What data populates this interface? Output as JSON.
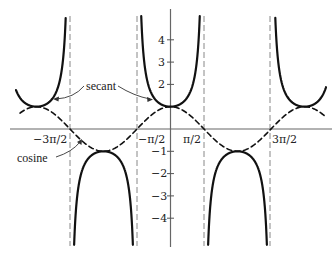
{
  "chart_data": {
    "type": "line",
    "title": "",
    "xlabel": "",
    "ylabel": "",
    "xlim": [
      -5.0,
      5.0
    ],
    "ylim": [
      -5.2,
      5.4
    ],
    "grid": false,
    "x_ticks": [
      {
        "value": -4.712389,
        "label": "−3π/2"
      },
      {
        "value": -1.570796,
        "label": "−π/2"
      },
      {
        "value": 1.570796,
        "label": "π/2"
      },
      {
        "value": 4.712389,
        "label": "3π/2"
      }
    ],
    "y_ticks": [
      {
        "value": 4,
        "label": "4"
      },
      {
        "value": 3,
        "label": "3"
      },
      {
        "value": 2,
        "label": "2"
      },
      {
        "value": 1,
        "label": ""
      },
      {
        "value": -1,
        "label": "−1"
      },
      {
        "value": -2,
        "label": "−2"
      },
      {
        "value": -3,
        "label": "−3"
      },
      {
        "value": -4,
        "label": "−4"
      }
    ],
    "series": [
      {
        "name": "secant",
        "function": "sec(x)",
        "style": "solid",
        "domain": [
          -6.8,
          6.8
        ]
      },
      {
        "name": "cosine",
        "function": "cos(x)",
        "style": "dashed",
        "domain": [
          -6.7,
          6.9
        ]
      }
    ],
    "asymptotes": [
      -4.712389,
      -1.570796,
      1.570796,
      4.712389
    ],
    "annotations": [
      {
        "text": "secant",
        "points_to": [
          "left secant branch near x=-5.6",
          "central secant branch near x=-0.7"
        ]
      },
      {
        "text": "cosine",
        "points_to": "cosine curve near x=-4.3"
      }
    ]
  },
  "labels": {
    "secant": "secant",
    "cosine": "cosine",
    "x_neg_3pi_2": "−3π/2",
    "x_neg_pi_2": "−π/2",
    "x_pi_2": "π/2",
    "x_3pi_2": "3π/2",
    "y_4": "4",
    "y_3": "3",
    "y_2": "2",
    "y_n1": "−1",
    "y_n2": "−2",
    "y_n3": "−3",
    "y_n4": "−4"
  },
  "colors": {
    "curve": "#111111",
    "axis": "#555555",
    "asymptote": "#777777"
  }
}
